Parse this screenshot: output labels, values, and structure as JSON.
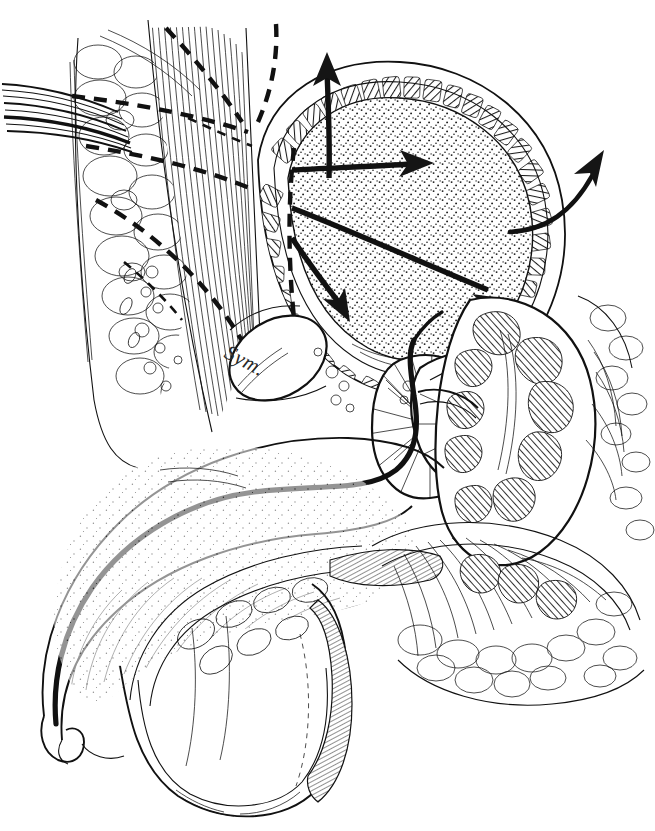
{
  "figure": {
    "kind": "anatomical-line-illustration",
    "medium": "pen-and-ink stipple and hatch drawing",
    "background_color": "#ffffff",
    "ink_color": "#111111",
    "width": 655,
    "height": 831
  },
  "labels": [
    {
      "id": "symphysis",
      "text": "Sym.",
      "meaning": "symphysis pubis",
      "x": 232,
      "y": 340,
      "rotation_deg": 28,
      "style": "italic-serif"
    }
  ],
  "annotations": {
    "arrows": [
      {
        "id": "arrow-dome-up",
        "kind": "straight",
        "direction": "up",
        "x1": 330,
        "y1": 160,
        "x2": 326,
        "y2": 62,
        "description": "force vector from bladder dome directed superiorly"
      },
      {
        "id": "arrow-upper-right",
        "kind": "straight",
        "direction": "right",
        "x1": 283,
        "y1": 168,
        "x2": 424,
        "y2": 163,
        "description": "horizontal force vector across upper bladder lumen"
      },
      {
        "id": "arrow-mid-right",
        "kind": "straight",
        "direction": "down-right",
        "x1": 283,
        "y1": 208,
        "x2": 503,
        "y2": 294,
        "description": "oblique force vector toward bladder base"
      },
      {
        "id": "arrow-lower-left",
        "kind": "straight",
        "direction": "down-right",
        "x1": 283,
        "y1": 230,
        "x2": 346,
        "y2": 305,
        "description": "oblique force vector toward anterior bladder floor"
      },
      {
        "id": "arrow-lateral-out",
        "kind": "curved",
        "direction": "up-right",
        "x1": 512,
        "y1": 230,
        "x2": 604,
        "y2": 148,
        "description": "curved arrow passing outward through lateral bladder wall"
      }
    ],
    "dashed_lines": [
      {
        "id": "wall-layer-upper",
        "description": "dashed line indicating anterior abdominal wall fascial plane, upper"
      },
      {
        "id": "wall-layer-middle",
        "description": "dashed line indicating transversalis fascia plane"
      },
      {
        "id": "wall-layer-lower",
        "description": "dashed line descending to the retropubic space"
      },
      {
        "id": "bladder-origin-line",
        "description": "dashed vertical line inside the bladder from which force arrows originate"
      }
    ]
  },
  "structures": [
    {
      "id": "subcutaneous-fat",
      "name": "Subcutaneous fat lobules",
      "region": "anterior abdominal wall",
      "texture": "bubbly lobule outlines"
    },
    {
      "id": "rectus-abdominis",
      "name": "Rectus abdominis muscle fibers",
      "region": "anterior abdominal wall",
      "texture": "long parallel fiber strokes"
    },
    {
      "id": "vessel-bundle",
      "name": "Vessel / cord bundle",
      "region": "upper left",
      "texture": "bundled straight lines"
    },
    {
      "id": "bladder-lumen",
      "name": "Urinary bladder lumen (distended)",
      "region": "pelvis",
      "texture": "fine stipple"
    },
    {
      "id": "detrusor-wall",
      "name": "Detrusor muscle wall",
      "region": "bladder",
      "texture": "hatched muscle bundle blocks"
    },
    {
      "id": "symphysis-pubis",
      "name": "Symphysis pubis",
      "region": "anterior pelvis",
      "texture": "blank ovoid with shading"
    },
    {
      "id": "prostate",
      "name": "Prostate gland",
      "region": "bladder neck",
      "texture": "radiating fine hatch"
    },
    {
      "id": "seminal-vesicle",
      "name": "Seminal vesicle",
      "region": "posterior to bladder",
      "texture": "coiled hatch lobes"
    },
    {
      "id": "rectum",
      "name": "Rectum",
      "region": "posterior pelvis",
      "texture": "dense mucosal hatching"
    },
    {
      "id": "urethra",
      "name": "Urethra",
      "region": "penis and pelvic floor",
      "texture": "bold solid black line"
    },
    {
      "id": "corpus-cavernosum",
      "name": "Corpus cavernosum / penile shaft",
      "region": "anterior inferior",
      "texture": "light stipple"
    },
    {
      "id": "scrotum",
      "name": "Scrotum and testis",
      "region": "inferior",
      "texture": "outline with edge hatch"
    },
    {
      "id": "pelvic-floor",
      "name": "Pelvic floor musculature",
      "region": "inferior pelvis",
      "texture": "fan-shaped fiber strokes"
    }
  ]
}
